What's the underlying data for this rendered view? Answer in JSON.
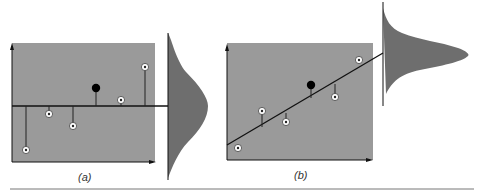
{
  "figure": {
    "panels": [
      {
        "id": "a",
        "label": "(a)",
        "description": "Horizontal mean line with residuals; distribution projected on right",
        "points": [
          {
            "x": 26,
            "y": 150
          },
          {
            "x": 49,
            "y": 114
          },
          {
            "x": 73,
            "y": 126
          },
          {
            "x": 121,
            "y": 100
          },
          {
            "x": 145,
            "y": 67
          }
        ],
        "mean_point": {
          "x": 96,
          "y": 88
        }
      },
      {
        "id": "b",
        "label": "(b)",
        "description": "Fitted regression line with residuals; narrower distribution projected on right",
        "points": [
          {
            "x": 238,
            "y": 148
          },
          {
            "x": 262,
            "y": 111
          },
          {
            "x": 286,
            "y": 122
          },
          {
            "x": 335,
            "y": 97
          },
          {
            "x": 359,
            "y": 60
          }
        ],
        "mean_point": {
          "x": 311,
          "y": 85
        }
      }
    ],
    "colors": {
      "plot_bg": "#9a9a9a",
      "curve_fill": "#6e6e6e",
      "line": "#111111",
      "point_fill": "#ffffff",
      "mean_point": "#000000",
      "divider": "#777777"
    }
  }
}
